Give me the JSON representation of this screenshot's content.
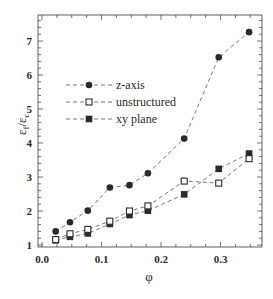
{
  "chart_data": {
    "type": "scatter",
    "title": "",
    "xlabel": "φ",
    "ylabel": "εf/εc",
    "xlim": [
      0.0,
      0.37
    ],
    "ylim": [
      1.0,
      7.8
    ],
    "xticks": [
      0.0,
      0.1,
      0.2,
      0.3
    ],
    "xtick_labels": [
      "0.0",
      "0.1",
      "0.2",
      "0.3"
    ],
    "yticks": [
      1,
      2,
      3,
      4,
      5,
      6,
      7
    ],
    "ytick_labels": [
      "1",
      "2",
      "3",
      "4",
      "5",
      "6",
      "7"
    ],
    "grid": false,
    "legend_position": "upper left (inside)",
    "series": [
      {
        "name": "z-axis",
        "marker": "filled-circle",
        "line": "dashed",
        "x": [
          0.023,
          0.047,
          0.077,
          0.114,
          0.147,
          0.178,
          0.239,
          0.297,
          0.348
        ],
        "y": [
          1.4,
          1.67,
          2.01,
          2.69,
          2.76,
          3.11,
          4.13,
          6.52,
          7.26
        ]
      },
      {
        "name": "unstructured",
        "marker": "open-square",
        "line": "dashed",
        "x": [
          0.023,
          0.047,
          0.077,
          0.114,
          0.147,
          0.178,
          0.239,
          0.297,
          0.348
        ],
        "y": [
          1.16,
          1.33,
          1.46,
          1.7,
          2.0,
          2.15,
          2.88,
          2.82,
          3.54
        ]
      },
      {
        "name": "xy plane",
        "marker": "filled-square",
        "line": "dashed",
        "x": [
          0.023,
          0.047,
          0.077,
          0.114,
          0.147,
          0.178,
          0.239,
          0.297,
          0.348
        ],
        "y": [
          1.14,
          1.24,
          1.34,
          1.62,
          1.88,
          2.01,
          2.49,
          3.24,
          3.69
        ]
      }
    ]
  },
  "legend": {
    "items": [
      {
        "label": "z-axis",
        "marker": "filled-circle"
      },
      {
        "label": "unstructured",
        "marker": "open-square"
      },
      {
        "label": "xy plane",
        "marker": "filled-square"
      }
    ]
  },
  "axes": {
    "xlabel": "φ",
    "ylabel_main": "ε",
    "ylabel_sub1": "f",
    "ylabel_sep": "/ε",
    "ylabel_sub2": "c"
  },
  "colors": {
    "ink": "#2a2a2a",
    "dash": "#555555",
    "background": "#ffffff"
  }
}
